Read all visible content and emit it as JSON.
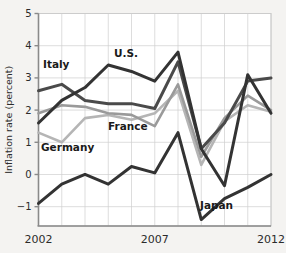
{
  "chart_data": {
    "type": "line",
    "title": "",
    "xlabel": "",
    "ylabel": "Inflation rate (percent)",
    "xlim": [
      2002,
      2012
    ],
    "ylim": [
      -1.6,
      5
    ],
    "yticks": [
      5,
      4,
      3,
      2,
      1,
      0,
      -1
    ],
    "ytick_labels": [
      "5",
      "4",
      "3",
      "2",
      "1",
      "0",
      "−1"
    ],
    "xticks": [
      2002,
      2003,
      2004,
      2005,
      2006,
      2007,
      2008,
      2009,
      2010,
      2011,
      2012
    ],
    "xtick_labels_shown": [
      "2002",
      "2007",
      "2012"
    ],
    "grid": true,
    "legend_position": "inline-annotations",
    "x": [
      2002,
      2003,
      2004,
      2005,
      2006,
      2007,
      2008,
      2009,
      2010,
      2011,
      2012
    ],
    "series": [
      {
        "name": "U.S.",
        "color": "#333333",
        "width": 3.0,
        "values": [
          1.6,
          2.3,
          2.7,
          3.4,
          3.2,
          2.9,
          3.8,
          0.8,
          -0.35,
          3.1,
          1.9
        ]
      },
      {
        "name": "Italy",
        "color": "#4a4a4a",
        "width": 3.0,
        "values": [
          2.6,
          2.8,
          2.3,
          2.2,
          2.2,
          2.05,
          3.5,
          0.8,
          1.6,
          2.9,
          3.0
        ]
      },
      {
        "name": "France",
        "color": "#9a9a9a",
        "width": 2.6,
        "values": [
          1.9,
          2.15,
          2.1,
          1.9,
          1.85,
          1.5,
          2.8,
          0.55,
          1.75,
          2.45,
          2.0
        ]
      },
      {
        "name": "Germany",
        "color": "#b5b5b5",
        "width": 2.6,
        "values": [
          1.3,
          1.0,
          1.75,
          1.85,
          1.7,
          1.9,
          2.6,
          0.3,
          1.65,
          2.15,
          1.95
        ]
      },
      {
        "name": "Japan",
        "color": "#333333",
        "width": 3.0,
        "values": [
          -0.9,
          -0.3,
          0.0,
          -0.3,
          0.25,
          0.05,
          1.3,
          -1.4,
          -0.75,
          -0.4,
          0.0
        ]
      }
    ],
    "annotations": [
      {
        "text": "Italy",
        "x_px": 43,
        "y_px": 68
      },
      {
        "text": "U.S.",
        "x_px": 114,
        "y_px": 57
      },
      {
        "text": "France",
        "x_px": 108,
        "y_px": 130
      },
      {
        "text": "Germany",
        "x_px": 41,
        "y_px": 151
      },
      {
        "text": "Japan",
        "x_px": 200,
        "y_px": 209
      }
    ]
  },
  "axis": {
    "y_title": "Inflation rate (percent)"
  }
}
